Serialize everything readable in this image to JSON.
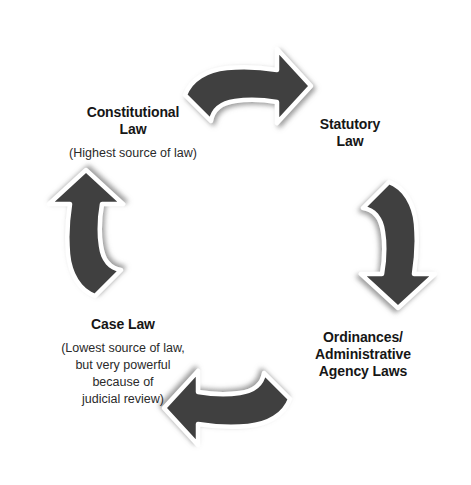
{
  "diagram": {
    "type": "cycle",
    "direction": "clockwise",
    "arrow_color": "#3f3f3f",
    "arrow_outline_color": "#ffffff",
    "text_color": "#161616",
    "background_color": "#ffffff",
    "nodes": [
      {
        "id": "constitutional-law",
        "title_line1": "Constitutional",
        "title_line2": "Law",
        "subtitle_lines": [
          "(Highest source of law)"
        ],
        "position": "top-left"
      },
      {
        "id": "statutory-law",
        "title_line1": "Statutory",
        "title_line2": "Law",
        "subtitle_lines": [],
        "position": "top-right"
      },
      {
        "id": "ordinances-administrative-agency-laws",
        "title_line1": "Ordinances/",
        "title_line2": "Administrative",
        "title_line3": "Agency Laws",
        "subtitle_lines": [],
        "position": "bottom-right"
      },
      {
        "id": "case-law",
        "title_line1": "Case Law",
        "subtitle_lines": [
          "(Lowest source of law,",
          "but very powerful",
          "because of",
          "judicial review)"
        ],
        "position": "bottom-left"
      }
    ],
    "arrows": [
      {
        "id": "arrow-top",
        "from": "constitutional-law",
        "to": "statutory-law"
      },
      {
        "id": "arrow-right",
        "from": "statutory-law",
        "to": "ordinances-administrative-agency-laws"
      },
      {
        "id": "arrow-bottom",
        "from": "ordinances-administrative-agency-laws",
        "to": "case-law"
      },
      {
        "id": "arrow-left",
        "from": "case-law",
        "to": "constitutional-law"
      }
    ]
  }
}
